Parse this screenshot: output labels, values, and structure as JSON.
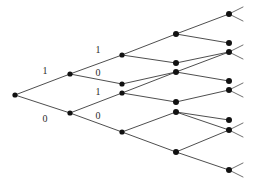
{
  "diagram": {
    "name": "binary-branching-trellis-diagram",
    "type": "tree",
    "background_color": "#ffffff",
    "edge_color": "#3a3a3a",
    "node_color": "#111111",
    "label_color": "#2b2b2b",
    "width": 256,
    "height": 185,
    "root": {
      "id": "root",
      "x": 15,
      "y": 95,
      "r": 2.6
    },
    "nodes": [
      {
        "id": "root",
        "x": 15,
        "y": 95,
        "r": 2.6
      },
      {
        "id": "n1a",
        "x": 70,
        "y": 74,
        "r": 2.6
      },
      {
        "id": "n1b",
        "x": 70,
        "y": 113,
        "r": 2.6
      },
      {
        "id": "n2a",
        "x": 122,
        "y": 55,
        "r": 2.6
      },
      {
        "id": "n2b",
        "x": 122,
        "y": 84,
        "r": 2.6
      },
      {
        "id": "n2c",
        "x": 122,
        "y": 93,
        "r": 2.6
      },
      {
        "id": "n2d",
        "x": 122,
        "y": 132,
        "r": 2.6
      },
      {
        "id": "n3a",
        "x": 176,
        "y": 34,
        "r": 3.0
      },
      {
        "id": "n3b",
        "x": 176,
        "y": 63,
        "r": 3.0
      },
      {
        "id": "n3c",
        "x": 176,
        "y": 72,
        "r": 3.0
      },
      {
        "id": "n3d",
        "x": 176,
        "y": 102,
        "r": 3.0
      },
      {
        "id": "n3e",
        "x": 176,
        "y": 112,
        "r": 3.0
      },
      {
        "id": "n3f",
        "x": 176,
        "y": 152,
        "r": 3.0
      },
      {
        "id": "n4a",
        "x": 229,
        "y": 14,
        "r": 3.0
      },
      {
        "id": "n4b",
        "x": 229,
        "y": 43,
        "r": 3.0
      },
      {
        "id": "n4c",
        "x": 229,
        "y": 52,
        "r": 3.0
      },
      {
        "id": "n4d",
        "x": 229,
        "y": 81,
        "r": 3.0
      },
      {
        "id": "n4e",
        "x": 229,
        "y": 90,
        "r": 3.0
      },
      {
        "id": "n4f",
        "x": 229,
        "y": 120,
        "r": 3.0
      },
      {
        "id": "n4g",
        "x": 229,
        "y": 130,
        "r": 3.0
      },
      {
        "id": "n4h",
        "x": 229,
        "y": 170,
        "r": 3.0
      }
    ],
    "edges": [
      {
        "from": "root",
        "to": "n1a",
        "bit": "1"
      },
      {
        "from": "root",
        "to": "n1b",
        "bit": "0"
      },
      {
        "from": "n1a",
        "to": "n2a",
        "bit": "1"
      },
      {
        "from": "n1a",
        "to": "n2b",
        "bit": "0"
      },
      {
        "from": "n1b",
        "to": "n2c",
        "bit": "1"
      },
      {
        "from": "n1b",
        "to": "n2d",
        "bit": "0"
      },
      {
        "from": "n2a",
        "to": "n3a",
        "bit": ""
      },
      {
        "from": "n2a",
        "to": "n3b",
        "bit": ""
      },
      {
        "from": "n2b",
        "to": "n3c",
        "bit": ""
      },
      {
        "from": "n2c",
        "to": "n3c",
        "bit": ""
      },
      {
        "from": "n2c",
        "to": "n3d",
        "bit": ""
      },
      {
        "from": "n2d",
        "to": "n3e",
        "bit": ""
      },
      {
        "from": "n2d",
        "to": "n3f",
        "bit": ""
      },
      {
        "from": "n3a",
        "to": "n4a",
        "bit": ""
      },
      {
        "from": "n3a",
        "to": "n4b",
        "bit": ""
      },
      {
        "from": "n3b",
        "to": "n4c",
        "bit": ""
      },
      {
        "from": "n3c",
        "to": "n4c",
        "bit": ""
      },
      {
        "from": "n3c",
        "to": "n4d",
        "bit": ""
      },
      {
        "from": "n3d",
        "to": "n4e",
        "bit": ""
      },
      {
        "from": "n3e",
        "to": "n4f",
        "bit": ""
      },
      {
        "from": "n3e",
        "to": "n4g",
        "bit": ""
      },
      {
        "from": "n3f",
        "to": "n4g",
        "bit": ""
      },
      {
        "from": "n3f",
        "to": "n4h",
        "bit": ""
      }
    ],
    "terminal_stubs": [
      {
        "node": "n4a",
        "dx": 14,
        "dy": -7
      },
      {
        "node": "n4a",
        "dx": 14,
        "dy": 7
      },
      {
        "node": "n4c",
        "dx": 14,
        "dy": -7
      },
      {
        "node": "n4c",
        "dx": 14,
        "dy": 7
      },
      {
        "node": "n4e",
        "dx": 14,
        "dy": -7
      },
      {
        "node": "n4e",
        "dx": 14,
        "dy": 7
      },
      {
        "node": "n4g",
        "dx": 14,
        "dy": -7
      },
      {
        "node": "n4g",
        "dx": 14,
        "dy": 7
      },
      {
        "node": "n4h",
        "dx": 14,
        "dy": -7
      },
      {
        "node": "n4h",
        "dx": 14,
        "dy": 7
      }
    ],
    "labels": [
      {
        "id": "label-l1-upper",
        "text": "1",
        "x": 45,
        "y": 71
      },
      {
        "id": "label-l1-lower",
        "text": "0",
        "x": 45,
        "y": 119
      },
      {
        "id": "label-l2-a",
        "text": "1",
        "x": 98,
        "y": 50
      },
      {
        "id": "label-l2-b",
        "text": "0",
        "x": 98,
        "y": 73
      },
      {
        "id": "label-l2-c",
        "text": "1",
        "x": 98,
        "y": 92
      },
      {
        "id": "label-l2-d",
        "text": "0",
        "x": 98,
        "y": 116
      }
    ]
  }
}
